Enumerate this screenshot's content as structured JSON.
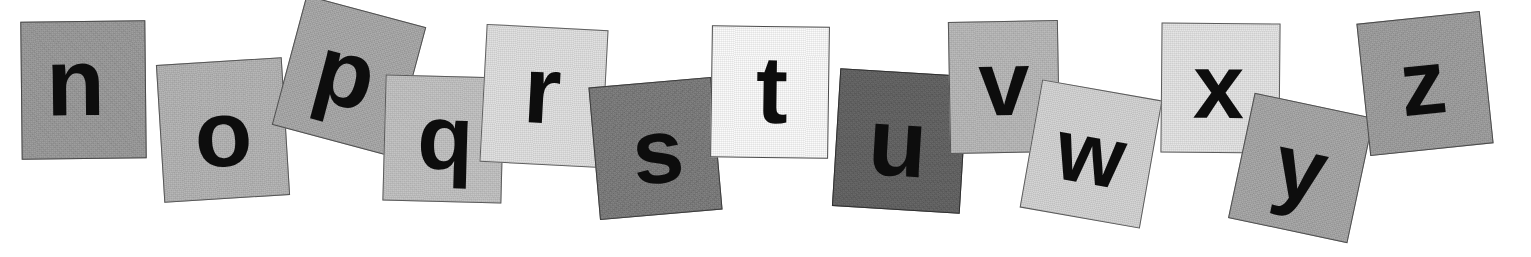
{
  "image": {
    "title": "Alphabet letter tiles n through z",
    "background_color": "#ffffff",
    "width": 1531,
    "height": 257,
    "sequence": "nopqrstuvwxyz"
  },
  "tiles": [
    {
      "letter": "n",
      "name": "letter-tile-n",
      "fill": "#9a9a9a",
      "border": "#4a4a4a",
      "x": 21,
      "y": 21,
      "w": 125,
      "h": 138,
      "rotate": -0.6,
      "font_size": 96,
      "glyph_dx": -8,
      "glyph_dy": -8
    },
    {
      "letter": "o",
      "name": "letter-tile-o",
      "fill": "#b4b4b4",
      "border": "#555555",
      "x": 160,
      "y": 61,
      "w": 126,
      "h": 138,
      "rotate": -3.5,
      "font_size": 94,
      "glyph_dx": 0,
      "glyph_dy": 4
    },
    {
      "letter": "p",
      "name": "letter-tile-p",
      "fill": "#a8a8a8",
      "border": "#4f4f4f",
      "x": 287,
      "y": 9,
      "w": 124,
      "h": 134,
      "rotate": 15.0,
      "font_size": 96,
      "glyph_dx": -4,
      "glyph_dy": -2
    },
    {
      "letter": "q",
      "name": "letter-tile-q",
      "fill": "#c2c2c2",
      "border": "#5a5a5a",
      "x": 384,
      "y": 76,
      "w": 119,
      "h": 126,
      "rotate": 1.5,
      "font_size": 92,
      "glyph_dx": 2,
      "glyph_dy": -2
    },
    {
      "letter": "r",
      "name": "letter-tile-r",
      "fill": "#e0e0e0",
      "border": "#5f5f5f",
      "x": 483,
      "y": 27,
      "w": 122,
      "h": 138,
      "rotate": 3.0,
      "font_size": 96,
      "glyph_dx": -2,
      "glyph_dy": -6
    },
    {
      "letter": "s",
      "name": "letter-tile-s",
      "fill": "#7b7b7b",
      "border": "#3c3c3c",
      "x": 594,
      "y": 82,
      "w": 123,
      "h": 133,
      "rotate": -5.0,
      "font_size": 92,
      "glyph_dx": 2,
      "glyph_dy": 2
    },
    {
      "letter": "t",
      "name": "letter-tile-t",
      "fill": "#fbfbfb",
      "border": "#4a4a4a",
      "x": 711,
      "y": 26,
      "w": 118,
      "h": 132,
      "rotate": 0.8,
      "font_size": 96,
      "glyph_dx": 2,
      "glyph_dy": -2
    },
    {
      "letter": "u",
      "name": "letter-tile-u",
      "fill": "#636363",
      "border": "#2f2f2f",
      "x": 836,
      "y": 72,
      "w": 128,
      "h": 138,
      "rotate": 3.5,
      "font_size": 96,
      "glyph_dx": -2,
      "glyph_dy": 2
    },
    {
      "letter": "v",
      "name": "letter-tile-v",
      "fill": "#b8b8b8",
      "border": "#565656",
      "x": 949,
      "y": 21,
      "w": 110,
      "h": 132,
      "rotate": -1.0,
      "font_size": 92,
      "glyph_dx": 0,
      "glyph_dy": -4
    },
    {
      "letter": "w",
      "name": "letter-tile-w",
      "fill": "#d4d4d4",
      "border": "#5a5a5a",
      "x": 1030,
      "y": 89,
      "w": 122,
      "h": 130,
      "rotate": 10.0,
      "font_size": 88,
      "glyph_dx": 0,
      "glyph_dy": 0
    },
    {
      "letter": "x",
      "name": "letter-tile-x",
      "fill": "#e4e4e4",
      "border": "#5c5c5c",
      "x": 1161,
      "y": 23,
      "w": 119,
      "h": 130,
      "rotate": 0.5,
      "font_size": 92,
      "glyph_dx": -2,
      "glyph_dy": -2
    },
    {
      "letter": "y",
      "name": "letter-tile-y",
      "fill": "#a6a6a6",
      "border": "#4e4e4e",
      "x": 1240,
      "y": 104,
      "w": 122,
      "h": 128,
      "rotate": 12.0,
      "font_size": 92,
      "glyph_dx": 0,
      "glyph_dy": 0
    },
    {
      "letter": "z",
      "name": "letter-tile-z",
      "fill": "#9e9e9e",
      "border": "#4a4a4a",
      "x": 1363,
      "y": 17,
      "w": 124,
      "h": 133,
      "rotate": -6.0,
      "font_size": 92,
      "glyph_dx": -2,
      "glyph_dy": -2
    }
  ]
}
